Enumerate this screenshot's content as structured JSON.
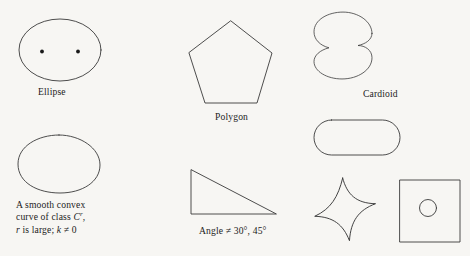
{
  "figure": {
    "background_color": "#f7f6f3",
    "stroke_color": "#3a3a3a",
    "width": 470,
    "height": 256
  },
  "captions": {
    "ellipse": "Ellipse",
    "polygon": "Polygon",
    "cardioid": "Cardioid",
    "smooth_line1": "A smooth convex",
    "smooth_line2_pre": "curve of class ",
    "smooth_line2_var": "C",
    "smooth_line2_exp": "r",
    "smooth_line2_post": ",",
    "smooth_line3_var1": "r",
    "smooth_line3_mid": " is large; ",
    "smooth_line3_var2": "k",
    "smooth_line3_post": " ≠ 0",
    "angle": "Angle ≠ 30°, 45°"
  },
  "shapes": {
    "ellipse": "ellipse-with-two-foci",
    "polygon": "pentagon",
    "cardioid": "cardioid",
    "smooth_convex": "smooth-convex-oval",
    "stadium": "rounded-rectangle",
    "triangle": "right-triangle",
    "astroid": "astroid-four-cusp-star",
    "square_circle": "square-with-inner-circle"
  }
}
